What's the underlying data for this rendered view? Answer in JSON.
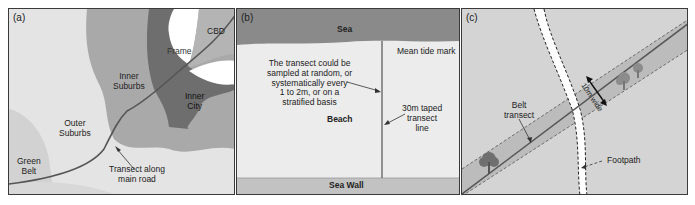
{
  "panels": [
    {
      "id": "a",
      "label": "(a)",
      "zones": {
        "cbd": "CBD",
        "frame": "Frame",
        "inner_city": [
          "Inner",
          "City"
        ],
        "inner_suburbs": [
          "Inner",
          "Suburbs"
        ],
        "outer_suburbs": [
          "Outer",
          "Suburbs"
        ],
        "green_belt": [
          "Green",
          "Belt"
        ]
      },
      "annotation": [
        "Transect along",
        "main road"
      ]
    },
    {
      "id": "b",
      "label": "(b)",
      "sea": "Sea",
      "mean_tide_mark": "Mean tide mark",
      "beach": "Beach",
      "sea_wall": "Sea Wall",
      "sampling_note": [
        "The transect could be",
        "sampled at random, or",
        "systematically every",
        "1 to 2m, or on a",
        "stratified basis"
      ],
      "transect_label": [
        "30m taped",
        "transect",
        "line"
      ]
    },
    {
      "id": "c",
      "label": "(c)",
      "belt_transect": [
        "Belt",
        "transect"
      ],
      "width_label": "10m wide",
      "footpath": "Footpath"
    }
  ],
  "colors": {
    "outer": "#e4e4e4",
    "green_belt": "#d2d2d2",
    "inner_suburbs": "#a9a9a9",
    "inner_city": "#6e6e6e",
    "frame": "#ffffff",
    "cbd": "#b4b4b4",
    "sea": "#8a8a8a",
    "sea_wall": "#c2c2c2",
    "belt": "#bcbcbc"
  }
}
